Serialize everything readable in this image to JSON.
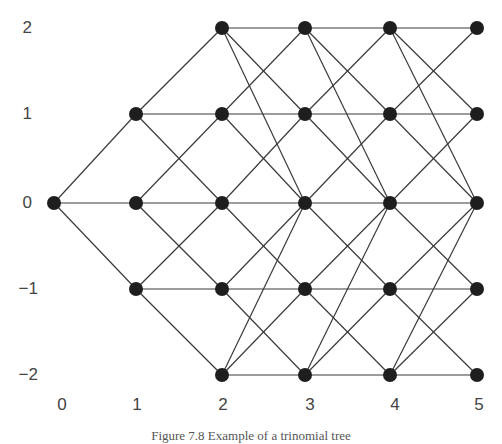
{
  "figure": {
    "caption": "Figure 7.8   Example of a trinomial tree",
    "node_color": "#1e1e1e",
    "edge_color": "#3a3a3a",
    "label_color": "#444444"
  },
  "axes": {
    "y_ticks": [
      {
        "label": "2",
        "value": 2
      },
      {
        "label": "1",
        "value": 1
      },
      {
        "label": "0",
        "value": 0
      },
      {
        "label": "−1",
        "value": -1
      },
      {
        "label": "−2",
        "value": -2
      }
    ],
    "x_ticks": [
      {
        "label": "0",
        "value": 0
      },
      {
        "label": "1",
        "value": 1
      },
      {
        "label": "2",
        "value": 2
      },
      {
        "label": "3",
        "value": 3
      },
      {
        "label": "4",
        "value": 4
      },
      {
        "label": "5",
        "value": 5
      }
    ]
  },
  "tree": {
    "steps": [
      0,
      1,
      2,
      3,
      4,
      5
    ],
    "levels_per_step": [
      [
        0
      ],
      [
        1,
        0,
        -1
      ],
      [
        2,
        1,
        0,
        -1,
        -2
      ],
      [
        2,
        1,
        0,
        -1,
        -2
      ],
      [
        2,
        1,
        0,
        -1,
        -2
      ],
      [
        2,
        1,
        0,
        -1,
        -2
      ]
    ],
    "transition_rule": "interior levels (1,0,-1) branch to +1/0/-1; boundary levels (+2/-2) branch to same level, one step inward, and two steps inward (to 0)"
  }
}
